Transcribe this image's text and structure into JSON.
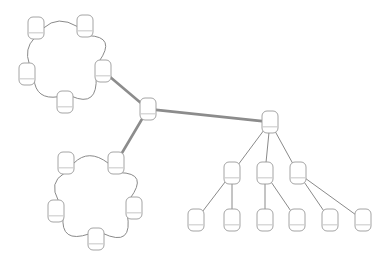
{
  "diagram": {
    "type": "node-link-topology",
    "canvas": {
      "width": 385,
      "height": 263,
      "background": "#ffffff"
    },
    "colors": {
      "node_fill": "#ffffff",
      "node_stroke": "#9a9a9a",
      "node_divider": "#b9b9b9",
      "link_thin": "#8a8a8a",
      "link_thick": "#8c8c8c"
    },
    "node_shape": {
      "kind": "rounded-rectangle",
      "width": 16,
      "height": 22,
      "corner_radius": 5,
      "divider_offset_ratio": 0.72
    },
    "clusters": [
      {
        "id": "ring-top",
        "kind": "ring",
        "node_count": 5,
        "center_x": 68,
        "center_y": 62,
        "radius": 42
      },
      {
        "id": "ring-bottom",
        "kind": "ring",
        "node_count": 5,
        "center_x": 97,
        "center_y": 200,
        "radius": 45
      },
      {
        "id": "hub",
        "kind": "single",
        "node_count": 1
      },
      {
        "id": "tree-right",
        "kind": "tree",
        "node_count": 10,
        "depth": 3
      }
    ],
    "nodes": [
      {
        "id": "t1",
        "cluster": "ring-top",
        "label": "",
        "x": 36,
        "y": 28
      },
      {
        "id": "t2",
        "cluster": "ring-top",
        "label": "",
        "x": 85,
        "y": 26
      },
      {
        "id": "t3",
        "cluster": "ring-top",
        "label": "",
        "x": 103,
        "y": 71
      },
      {
        "id": "t4",
        "cluster": "ring-top",
        "label": "",
        "x": 65,
        "y": 102
      },
      {
        "id": "t5",
        "cluster": "ring-top",
        "label": "",
        "x": 27,
        "y": 74
      },
      {
        "id": "hub",
        "cluster": "hub",
        "label": "",
        "x": 148,
        "y": 109
      },
      {
        "id": "b1",
        "cluster": "ring-bottom",
        "label": "",
        "x": 66,
        "y": 163
      },
      {
        "id": "b2",
        "cluster": "ring-bottom",
        "label": "",
        "x": 116,
        "y": 163
      },
      {
        "id": "b3",
        "cluster": "ring-bottom",
        "label": "",
        "x": 134,
        "y": 208
      },
      {
        "id": "b4",
        "cluster": "ring-bottom",
        "label": "",
        "x": 96,
        "y": 239
      },
      {
        "id": "b5",
        "cluster": "ring-bottom",
        "label": "",
        "x": 56,
        "y": 211
      },
      {
        "id": "r0",
        "cluster": "tree-right",
        "label": "",
        "x": 270,
        "y": 122
      },
      {
        "id": "m1",
        "cluster": "tree-right",
        "label": "",
        "x": 232,
        "y": 173
      },
      {
        "id": "m2",
        "cluster": "tree-right",
        "label": "",
        "x": 265,
        "y": 173
      },
      {
        "id": "m3",
        "cluster": "tree-right",
        "label": "",
        "x": 298,
        "y": 173
      },
      {
        "id": "l1",
        "cluster": "tree-right",
        "label": "",
        "x": 196,
        "y": 220
      },
      {
        "id": "l2",
        "cluster": "tree-right",
        "label": "",
        "x": 232,
        "y": 220
      },
      {
        "id": "l3",
        "cluster": "tree-right",
        "label": "",
        "x": 265,
        "y": 220
      },
      {
        "id": "l4",
        "cluster": "tree-right",
        "label": "",
        "x": 297,
        "y": 220
      },
      {
        "id": "l5",
        "cluster": "tree-right",
        "label": "",
        "x": 330,
        "y": 220
      },
      {
        "id": "l6",
        "cluster": "tree-right",
        "label": "",
        "x": 363,
        "y": 220
      }
    ],
    "links": [
      {
        "from": "t1",
        "to": "t2",
        "style": "arc",
        "weight": "thin"
      },
      {
        "from": "t2",
        "to": "t3",
        "style": "arc",
        "weight": "thin"
      },
      {
        "from": "t3",
        "to": "t4",
        "style": "arc",
        "weight": "thin"
      },
      {
        "from": "t4",
        "to": "t5",
        "style": "arc",
        "weight": "thin"
      },
      {
        "from": "t5",
        "to": "t1",
        "style": "arc",
        "weight": "thin"
      },
      {
        "from": "b1",
        "to": "b2",
        "style": "arc",
        "weight": "thin"
      },
      {
        "from": "b2",
        "to": "b3",
        "style": "arc",
        "weight": "thin"
      },
      {
        "from": "b3",
        "to": "b4",
        "style": "arc",
        "weight": "thin"
      },
      {
        "from": "b4",
        "to": "b5",
        "style": "arc",
        "weight": "thin"
      },
      {
        "from": "b5",
        "to": "b1",
        "style": "arc",
        "weight": "thin"
      },
      {
        "from": "t3",
        "to": "hub",
        "style": "straight",
        "weight": "thick"
      },
      {
        "from": "hub",
        "to": "b2",
        "style": "straight",
        "weight": "thick"
      },
      {
        "from": "hub",
        "to": "r0",
        "style": "straight",
        "weight": "thick"
      },
      {
        "from": "r0",
        "to": "m1",
        "style": "straight",
        "weight": "thin"
      },
      {
        "from": "r0",
        "to": "m2",
        "style": "straight",
        "weight": "thin"
      },
      {
        "from": "r0",
        "to": "m3",
        "style": "straight",
        "weight": "thin"
      },
      {
        "from": "m1",
        "to": "l1",
        "style": "straight",
        "weight": "thin"
      },
      {
        "from": "m1",
        "to": "l2",
        "style": "straight",
        "weight": "thin"
      },
      {
        "from": "m2",
        "to": "l3",
        "style": "straight",
        "weight": "thin"
      },
      {
        "from": "m2",
        "to": "l4",
        "style": "straight",
        "weight": "thin"
      },
      {
        "from": "m3",
        "to": "l5",
        "style": "straight",
        "weight": "thin"
      },
      {
        "from": "m3",
        "to": "l6",
        "style": "straight",
        "weight": "thin"
      }
    ]
  }
}
